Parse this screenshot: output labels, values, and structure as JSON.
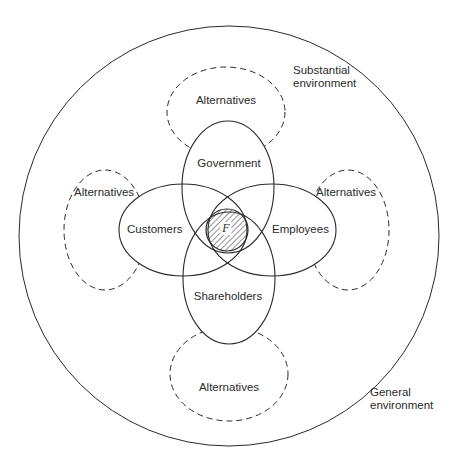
{
  "diagram": {
    "type": "nested-environment-venn",
    "outer_circle_label": "General environment",
    "inner_region_label": "Substantial environment",
    "center": {
      "label": "F",
      "style": "hatched"
    },
    "stakeholders": [
      {
        "id": "government",
        "label": "Government",
        "position": "top"
      },
      {
        "id": "customers",
        "label": "Customers",
        "position": "left"
      },
      {
        "id": "employees",
        "label": "Employees",
        "position": "right"
      },
      {
        "id": "shareholders",
        "label": "Shareholders",
        "position": "bottom"
      }
    ],
    "alternatives": [
      {
        "label": "Alternatives",
        "position": "top",
        "style": "dashed"
      },
      {
        "label": "Alternatives",
        "position": "left",
        "style": "dashed"
      },
      {
        "label": "Alternatives",
        "position": "right",
        "style": "dashed"
      },
      {
        "label": "Alternatives",
        "position": "bottom",
        "style": "dashed"
      }
    ],
    "colors": {
      "stroke": "#2a2a2a",
      "background": "#ffffff"
    }
  }
}
